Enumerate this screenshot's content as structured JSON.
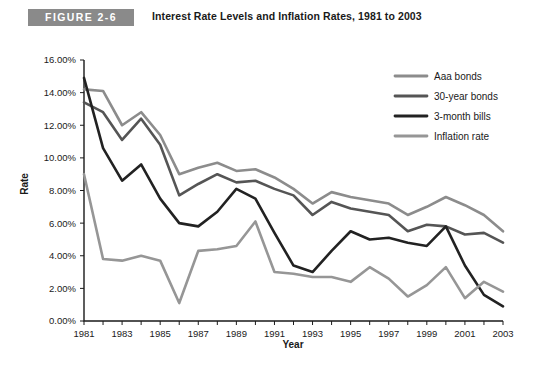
{
  "figure": {
    "badge": "FIGURE 2-6",
    "title": "Interest Rate Levels and Inflation Rates, 1981 to 2003"
  },
  "chart_data": {
    "type": "line",
    "title": "Interest Rate Levels and Inflation Rates, 1981 to 2003",
    "xlabel": "Year",
    "ylabel": "Rate",
    "xlim": [
      1981,
      2003
    ],
    "ylim": [
      0,
      16
    ],
    "ytick_values": [
      0,
      2,
      4,
      6,
      8,
      10,
      12,
      14,
      16
    ],
    "ytick_labels": [
      "0.00%",
      "2.00%",
      "4.00%",
      "6.00%",
      "8.00%",
      "10.00%",
      "12.00%",
      "14.00%",
      "16.00%"
    ],
    "xtick_values": [
      1981,
      1982,
      1983,
      1984,
      1985,
      1986,
      1987,
      1988,
      1989,
      1990,
      1991,
      1992,
      1993,
      1994,
      1995,
      1996,
      1997,
      1998,
      1999,
      2000,
      2001,
      2002,
      2003
    ],
    "xtick_labels_shown": [
      "1981",
      "1983",
      "1985",
      "1987",
      "1989",
      "1991",
      "1993",
      "1995",
      "1997",
      "1999",
      "2001",
      "2003"
    ],
    "grid": false,
    "legend_position": "top-right",
    "x": [
      1981,
      1982,
      1983,
      1984,
      1985,
      1986,
      1987,
      1988,
      1989,
      1990,
      1991,
      1992,
      1993,
      1994,
      1995,
      1996,
      1997,
      1998,
      1999,
      2000,
      2001,
      2002,
      2003
    ],
    "series": [
      {
        "name": "Aaa bonds",
        "color": "#8c8c8c",
        "width": 2.6,
        "values": [
          14.2,
          14.1,
          12.0,
          12.8,
          11.4,
          9.0,
          9.4,
          9.7,
          9.2,
          9.3,
          8.8,
          8.1,
          7.2,
          7.9,
          7.6,
          7.4,
          7.2,
          6.5,
          7.0,
          7.6,
          7.1,
          6.5,
          5.5
        ]
      },
      {
        "name": "30-year bonds",
        "color": "#555555",
        "width": 2.6,
        "values": [
          13.4,
          12.8,
          11.1,
          12.4,
          10.8,
          7.7,
          8.4,
          9.0,
          8.5,
          8.6,
          8.1,
          7.7,
          6.5,
          7.3,
          6.9,
          6.7,
          6.5,
          5.5,
          5.9,
          5.8,
          5.3,
          5.4,
          4.8
        ]
      },
      {
        "name": "3-month bills",
        "color": "#222222",
        "width": 2.6,
        "values": [
          14.9,
          10.6,
          8.6,
          9.6,
          7.5,
          6.0,
          5.8,
          6.7,
          8.1,
          7.5,
          5.4,
          3.4,
          3.0,
          4.3,
          5.5,
          5.0,
          5.1,
          4.8,
          4.6,
          5.8,
          3.4,
          1.6,
          0.9
        ]
      },
      {
        "name": "Inflation rate",
        "color": "#969696",
        "width": 2.6,
        "values": [
          9.0,
          3.8,
          3.7,
          4.0,
          3.7,
          1.1,
          4.3,
          4.4,
          4.6,
          6.1,
          3.0,
          2.9,
          2.7,
          2.7,
          2.4,
          3.3,
          2.6,
          1.5,
          2.2,
          3.3,
          1.4,
          2.4,
          1.8
        ]
      }
    ]
  },
  "legend": {
    "items": [
      {
        "label": "Aaa bonds",
        "color": "#8c8c8c"
      },
      {
        "label": "30-year bonds",
        "color": "#555555"
      },
      {
        "label": "3-month bills",
        "color": "#222222"
      },
      {
        "label": "Inflation rate",
        "color": "#969696"
      }
    ]
  }
}
